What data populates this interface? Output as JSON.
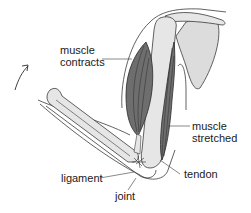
{
  "diagram": {
    "labels": {
      "muscle_contracts_line1": "muscle",
      "muscle_contracts_line2": "contracts",
      "muscle_stretched_line1": "muscle",
      "muscle_stretched_line2": "stretched",
      "ligament": "ligament",
      "tendon": "tendon",
      "joint": "joint"
    },
    "icons": {
      "motion_arrow": "curved-arrow-up-right"
    },
    "colors": {
      "background": "#ffffff",
      "outline": "#3a3a3a",
      "bone_fill": "#e6e6e6",
      "muscle_fill": "#6e6e6e",
      "muscle_fiber": "#2a2a2a",
      "scapula_fill": "#dcdcdc",
      "text": "#1a1a1a"
    }
  }
}
